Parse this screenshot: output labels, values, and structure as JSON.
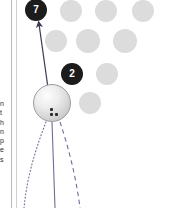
{
  "canvas": {
    "width": 170,
    "height": 208,
    "background": "#ffffff"
  },
  "margin": {
    "rule_color": "#b9b9b9",
    "inner_rule_color": "#cfcfcf",
    "clipped_text_lines": [
      "n",
      "t",
      "h",
      "n",
      "p",
      "e",
      "s"
    ]
  },
  "colors": {
    "ghost_ball": "#dcdcdc",
    "numbered_ball": "#1c1c1c",
    "numbered_ball_text": "#ffffff",
    "cue_ball_light": "#fdfdfd",
    "cue_ball_shadow": "#b0b0b0",
    "line": "#6e6e94",
    "arrow": "#3a3a52"
  },
  "cue_ball": {
    "label": "cue-ball",
    "cx": 52,
    "cy": 103,
    "r": 19,
    "spin_marks": [
      {
        "x": 50,
        "y": 108
      },
      {
        "x": 50,
        "y": 113
      },
      {
        "x": 55,
        "y": 113
      }
    ]
  },
  "numbered_balls": [
    {
      "number": "7",
      "cx": 36,
      "cy": 10,
      "r": 11
    },
    {
      "number": "2",
      "cx": 72,
      "cy": 74,
      "r": 11
    }
  ],
  "ghost_balls": [
    {
      "cx": 71,
      "cy": 11,
      "r": 11
    },
    {
      "cx": 106,
      "cy": 11,
      "r": 11
    },
    {
      "cx": 143,
      "cy": 11,
      "r": 11
    },
    {
      "cx": 56,
      "cy": 41,
      "r": 11
    },
    {
      "cx": 88,
      "cy": 41,
      "r": 12
    },
    {
      "cx": 125,
      "cy": 41,
      "r": 12
    },
    {
      "cx": 107,
      "cy": 74,
      "r": 11
    },
    {
      "cx": 90,
      "cy": 103,
      "r": 11
    }
  ],
  "aim_arrow": {
    "name": "aim-arrow",
    "from": {
      "x": 48,
      "y": 88
    },
    "to": {
      "x": 39,
      "y": 24
    },
    "style": "solid-with-head"
  },
  "trajectories": [
    {
      "name": "spin-curve-left",
      "style": "dotted",
      "d": "M 46 122 C 36 148 27 176 24 208"
    },
    {
      "name": "center-path",
      "style": "solid",
      "d": "M 52 122 L 55 208"
    },
    {
      "name": "deflection-curve-right",
      "style": "dashed",
      "d": "M 60 122 C 68 146 76 176 80 208"
    }
  ]
}
